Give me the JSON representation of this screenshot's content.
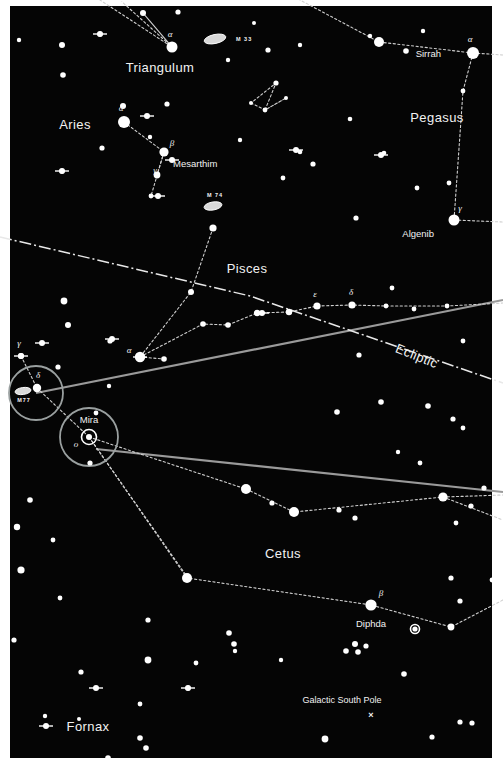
{
  "chart": {
    "kind": "star-chart",
    "width": 503,
    "height": 769,
    "background_color": "#050505",
    "frame_color": "#ffffff",
    "star_color": "#ffffff",
    "label_color": "#f2f2f2",
    "constellation_line_color": "#cfcfcf",
    "boundary_line_color": "#9a9a9a",
    "ecliptic_color": "#e8e8e8",
    "highlight_circle_color": "#9aa0a0"
  },
  "constellations": [
    {
      "name": "Triangulum",
      "x": 160,
      "y": 72
    },
    {
      "name": "Aries",
      "x": 75,
      "y": 129
    },
    {
      "name": "Pegasus",
      "x": 437,
      "y": 122
    },
    {
      "name": "Pisces",
      "x": 247,
      "y": 273
    },
    {
      "name": "Cetus",
      "x": 283,
      "y": 558
    },
    {
      "name": "Fornax",
      "x": 88,
      "y": 731
    }
  ],
  "named_stars": [
    {
      "name": "Sirrah",
      "greek": "α",
      "x": 473,
      "y": 53,
      "mag": 1,
      "label_dx": -32,
      "label_dy": 4,
      "greek_dx": -3,
      "greek_dy": -11
    },
    {
      "name": "Algenib",
      "greek": "γ",
      "x": 454,
      "y": 220,
      "mag": 1,
      "label_dx": -20,
      "label_dy": 17,
      "greek_dx": 6,
      "greek_dy": -9
    },
    {
      "name": "Mesarthim",
      "greek": "β",
      "x": 164,
      "y": 152,
      "mag": 2,
      "label_dx": 9,
      "label_dy": 15,
      "greek_dx": 8,
      "greek_dy": -6
    },
    {
      "name": "Mira",
      "greek": "ο",
      "x": 89,
      "y": 437,
      "mag": 0,
      "label_dx": 0,
      "label_dy": -14,
      "greek_dx": -13,
      "greek_dy": 10
    },
    {
      "name": "Diphda",
      "greek": "β",
      "x": 371,
      "y": 605,
      "mag": 1,
      "label_dx": 0,
      "label_dy": 22,
      "greek_dx": 10,
      "greek_dy": -9
    }
  ],
  "greek_only_labels": [
    {
      "greek": "α",
      "x": 172,
      "y": 47,
      "dx": -2,
      "dy": -10
    },
    {
      "greek": "α",
      "x": 124,
      "y": 122,
      "dx": -3,
      "dy": -11
    },
    {
      "greek": "γ",
      "x": 151,
      "y": 178,
      "dx": 4,
      "dy": -5
    },
    {
      "greek": "α",
      "x": 140,
      "y": 357,
      "dx": -11,
      "dy": -4
    },
    {
      "greek": "ε",
      "x": 317,
      "y": 306,
      "dx": -2,
      "dy": -9
    },
    {
      "greek": "δ",
      "x": 352,
      "y": 305,
      "dx": -1,
      "dy": -10
    },
    {
      "greek": "γ",
      "x": 21,
      "y": 356,
      "dx": -2,
      "dy": -10
    },
    {
      "greek": "δ",
      "x": 37,
      "y": 388,
      "dx": 1,
      "dy": -10
    }
  ],
  "messier_objects": [
    {
      "name": "M 33",
      "x": 215,
      "y": 39,
      "label_dx": 21,
      "label_dy": 2,
      "rx": 11,
      "ry": 4.5,
      "rot": -12
    },
    {
      "name": "M 74",
      "x": 213,
      "y": 206,
      "label_dx": 2,
      "label_dy": -9,
      "rx": 9,
      "ry": 4,
      "rot": -10
    },
    {
      "name": "M77",
      "x": 23,
      "y": 391,
      "label_dx": 1,
      "label_dy": 11,
      "rx": 8,
      "ry": 3.5,
      "rot": -8
    }
  ],
  "annotations": [
    {
      "name": "Ecliptic",
      "x": 415,
      "y": 360,
      "rotate": 22
    },
    {
      "name": "Galactic South Pole",
      "x": 342,
      "y": 703,
      "marker_x": 371,
      "marker_y": 718,
      "marker": "×"
    }
  ],
  "highlight_circles": [
    {
      "label": "M77-region",
      "cx": 36,
      "cy": 393,
      "r": 27
    },
    {
      "label": "Mira-region",
      "cx": 89,
      "cy": 437,
      "r": 29
    }
  ],
  "variable_star_markers": [
    {
      "label": "Mira",
      "x": 89,
      "y": 437,
      "r_outer": 7.5,
      "r_inner": 3
    },
    {
      "label": "unnamed-variable",
      "x": 415,
      "y": 629,
      "r_outer": 4.5,
      "r_inner": 1.8
    }
  ],
  "chart_data": {
    "type": "scatter",
    "xlabel": "",
    "ylabel": "",
    "xlim": [
      0,
      503
    ],
    "ylim": [
      0,
      769
    ],
    "grid": false,
    "legend": "none",
    "stars": [
      [
        172,
        47,
        5.5
      ],
      [
        143,
        13,
        3.0
      ],
      [
        120,
        0,
        2.2
      ],
      [
        100,
        34,
        2.6
      ],
      [
        62,
        45,
        3.0
      ],
      [
        178,
        12,
        2.6
      ],
      [
        228,
        60,
        2.2
      ],
      [
        254,
        23,
        2.0
      ],
      [
        268,
        50,
        2.6
      ],
      [
        276,
        83,
        2.6
      ],
      [
        300,
        45,
        2.2
      ],
      [
        265,
        110,
        2.4
      ],
      [
        286,
        98,
        2.0
      ],
      [
        251,
        103,
        2.0
      ],
      [
        240,
        140,
        2.2
      ],
      [
        300,
        152,
        2.3
      ],
      [
        384,
        153,
        2.3
      ],
      [
        379,
        42,
        5.0
      ],
      [
        406,
        51,
        2.8
      ],
      [
        423,
        31,
        2.2
      ],
      [
        473,
        53,
        6.0
      ],
      [
        463,
        91,
        2.4
      ],
      [
        370,
        36,
        2.2
      ],
      [
        350,
        119,
        2.3
      ],
      [
        313,
        164,
        2.6
      ],
      [
        283,
        178,
        2.4
      ],
      [
        356,
        218,
        2.6
      ],
      [
        454,
        220,
        5.5
      ],
      [
        449,
        183,
        2.4
      ],
      [
        417,
        188,
        2.4
      ],
      [
        124,
        122,
        6.0
      ],
      [
        150,
        137,
        2.2
      ],
      [
        164,
        152,
        4.6
      ],
      [
        157,
        175,
        3.4
      ],
      [
        151,
        196,
        2.4
      ],
      [
        102,
        148,
        2.6
      ],
      [
        123,
        106,
        3.0
      ],
      [
        62,
        171,
        2.6
      ],
      [
        167,
        104,
        2.6
      ],
      [
        63,
        75,
        2.8
      ],
      [
        19,
        40,
        2.2
      ],
      [
        0,
        113,
        2.6
      ],
      [
        1,
        121,
        2.4
      ],
      [
        64,
        301,
        3.4
      ],
      [
        68,
        325,
        3.0
      ],
      [
        110,
        341,
        2.6
      ],
      [
        21,
        356,
        3.0
      ],
      [
        37,
        388,
        4.2
      ],
      [
        58,
        367,
        2.6
      ],
      [
        140,
        357,
        5.2
      ],
      [
        164,
        359,
        2.8
      ],
      [
        191,
        292,
        3.0
      ],
      [
        213,
        228,
        3.6
      ],
      [
        203,
        324,
        2.8
      ],
      [
        228,
        325,
        2.8
      ],
      [
        257,
        313,
        3.2
      ],
      [
        289,
        312,
        3.2
      ],
      [
        317,
        306,
        3.6
      ],
      [
        352,
        305,
        3.6
      ],
      [
        386,
        306,
        2.4
      ],
      [
        414,
        309,
        2.4
      ],
      [
        447,
        306,
        2.4
      ],
      [
        463,
        341,
        2.4
      ],
      [
        359,
        355,
        2.6
      ],
      [
        392,
        288,
        2.4
      ],
      [
        428,
        406,
        2.8
      ],
      [
        453,
        419,
        2.6
      ],
      [
        463,
        428,
        2.4
      ],
      [
        337,
        412,
        2.8
      ],
      [
        381,
        402,
        2.8
      ],
      [
        246,
        489,
        5.0
      ],
      [
        294,
        512,
        5.0
      ],
      [
        272,
        503,
        2.6
      ],
      [
        339,
        510,
        2.6
      ],
      [
        355,
        518,
        2.6
      ],
      [
        443,
        497,
        4.6
      ],
      [
        471,
        506,
        2.6
      ],
      [
        484,
        488,
        2.6
      ],
      [
        456,
        523,
        2.4
      ],
      [
        187,
        578,
        5.0
      ],
      [
        371,
        605,
        5.6
      ],
      [
        451,
        578,
        2.6
      ],
      [
        460,
        601,
        2.6
      ],
      [
        492,
        580,
        2.4
      ],
      [
        451,
        627,
        3.4
      ],
      [
        415,
        629,
        2.6
      ],
      [
        229,
        633,
        2.8
      ],
      [
        346,
        651,
        2.8
      ],
      [
        358,
        652,
        2.8
      ],
      [
        235,
        651,
        2.2
      ],
      [
        148,
        620,
        2.6
      ],
      [
        90,
        463,
        2.6
      ],
      [
        30,
        500,
        2.8
      ],
      [
        17,
        527,
        3.2
      ],
      [
        53,
        540,
        2.4
      ],
      [
        21,
        570,
        3.6
      ],
      [
        60,
        598,
        2.4
      ],
      [
        14,
        640,
        2.6
      ],
      [
        148,
        660,
        3.4
      ],
      [
        81,
        672,
        2.6
      ],
      [
        234,
        644,
        2.8
      ],
      [
        355,
        644,
        3.0
      ],
      [
        366,
        646,
        2.6
      ],
      [
        404,
        674,
        2.8
      ],
      [
        325,
        739,
        3.4
      ],
      [
        140,
        738,
        2.8
      ],
      [
        146,
        748,
        2.8
      ],
      [
        108,
        758,
        2.8
      ],
      [
        79,
        719,
        2.0
      ],
      [
        460,
        722,
        2.6
      ],
      [
        472,
        723,
        2.6
      ],
      [
        432,
        737,
        2.6
      ],
      [
        140,
        704,
        2.4
      ],
      [
        196,
        663,
        2.4
      ],
      [
        281,
        660,
        2.2
      ],
      [
        45,
        716,
        2.2
      ],
      [
        188,
        688,
        2.6
      ],
      [
        96,
        413,
        2.4
      ],
      [
        109,
        386,
        2.2
      ],
      [
        420,
        463,
        2.4
      ],
      [
        398,
        452,
        2.2
      ]
    ],
    "bright_stars_with_spikes": [
      [
        100,
        34
      ],
      [
        147,
        116
      ],
      [
        62,
        171
      ],
      [
        172,
        160
      ],
      [
        158,
        196
      ],
      [
        296,
        150
      ],
      [
        381,
        155
      ],
      [
        21,
        356
      ],
      [
        42,
        343
      ],
      [
        112,
        339
      ],
      [
        140,
        357
      ],
      [
        262,
        313
      ],
      [
        96,
        688
      ],
      [
        46,
        726
      ],
      [
        188,
        688
      ]
    ],
    "constellation_lines": [
      {
        "name": "Triangulum",
        "points": [
          [
            120,
            0
          ],
          [
            172,
            47
          ],
          [
            143,
            13
          ],
          [
            172,
            47
          ],
          [
            100,
            0
          ]
        ]
      },
      {
        "name": "Aries",
        "points": [
          [
            124,
            122
          ],
          [
            164,
            152
          ],
          [
            151,
            196
          ]
        ]
      },
      {
        "name": "Aries-head",
        "points": [
          [
            164,
            152
          ],
          [
            157,
            175
          ]
        ]
      },
      {
        "name": "Pegasus-sq",
        "points": [
          [
            473,
            53
          ],
          [
            379,
            42
          ],
          [
            300,
            0
          ]
        ]
      },
      {
        "name": "Pegasus-right",
        "points": [
          [
            473,
            53
          ],
          [
            463,
            91
          ],
          [
            454,
            220
          ]
        ]
      },
      {
        "name": "Pegasus-left",
        "points": [
          [
            251,
            103
          ],
          [
            265,
            110
          ],
          [
            286,
            98
          ],
          [
            265,
            110
          ],
          [
            276,
            83
          ],
          [
            251,
            103
          ]
        ]
      },
      {
        "name": "Pisces-cord",
        "points": [
          [
            213,
            228
          ],
          [
            191,
            292
          ],
          [
            140,
            357
          ]
        ]
      },
      {
        "name": "Pisces-arm",
        "points": [
          [
            140,
            357
          ],
          [
            203,
            324
          ],
          [
            228,
            325
          ],
          [
            257,
            313
          ],
          [
            289,
            312
          ],
          [
            317,
            306
          ],
          [
            352,
            305
          ],
          [
            386,
            306
          ],
          [
            447,
            306
          ],
          [
            503,
            303
          ]
        ]
      },
      {
        "name": "Pisces-lower",
        "points": [
          [
            140,
            357
          ],
          [
            164,
            359
          ]
        ]
      },
      {
        "name": "Cetus-body",
        "points": [
          [
            37,
            388
          ],
          [
            89,
            437
          ]
        ]
      },
      {
        "name": "Cetus-upper",
        "points": [
          [
            89,
            437
          ],
          [
            246,
            489
          ],
          [
            294,
            512
          ],
          [
            443,
            497
          ],
          [
            503,
            495
          ]
        ]
      },
      {
        "name": "Cetus-lower",
        "points": [
          [
            89,
            437
          ],
          [
            187,
            578
          ],
          [
            371,
            605
          ],
          [
            451,
            627
          ],
          [
            503,
            600
          ]
        ]
      },
      {
        "name": "Cetus-right",
        "points": [
          [
            443,
            497
          ],
          [
            503,
            520
          ]
        ]
      },
      {
        "name": "Cetus-gamma",
        "points": [
          [
            21,
            356
          ],
          [
            37,
            388
          ]
        ]
      },
      {
        "name": "Sirrah-right",
        "points": [
          [
            473,
            53
          ],
          [
            503,
            55
          ]
        ]
      },
      {
        "name": "Algenib-right",
        "points": [
          [
            454,
            220
          ],
          [
            503,
            222
          ]
        ]
      },
      {
        "name": "Mira-branch",
        "points": [
          [
            89,
            437
          ],
          [
            188,
            578
          ]
        ]
      }
    ],
    "boundary_lines": [
      {
        "name": "boundary-upper",
        "points": [
          [
            36,
            393
          ],
          [
            503,
            300
          ]
        ]
      },
      {
        "name": "boundary-lower",
        "points": [
          [
            96,
            449
          ],
          [
            503,
            492
          ]
        ]
      }
    ],
    "ecliptic_line": {
      "name": "Ecliptic",
      "points": [
        [
          0,
          237
        ],
        [
          250,
          296
        ],
        [
          503,
          383
        ]
      ],
      "style": "dash-dot"
    }
  }
}
